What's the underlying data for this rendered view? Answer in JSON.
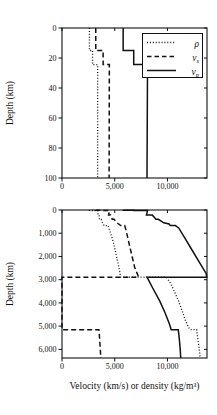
{
  "page": {
    "background": "#ffffff",
    "ink": "#111111"
  },
  "chart_data": [
    {
      "id": "shallow",
      "type": "line",
      "title": "",
      "xlabel": "",
      "ylabel": "Depth (km)",
      "xlim": [
        0,
        13750
      ],
      "ylim": [
        0,
        100
      ],
      "y_inverted": true,
      "grid": false,
      "xticks": [
        {
          "v": 0,
          "label": "0"
        },
        {
          "v": 5000,
          "label": "5,000"
        },
        {
          "v": 10000,
          "label": "10,000"
        }
      ],
      "yticks": [
        {
          "v": 0,
          "label": "0"
        },
        {
          "v": 20,
          "label": "20"
        },
        {
          "v": 40,
          "label": "40"
        },
        {
          "v": 60,
          "label": "60"
        },
        {
          "v": 80,
          "label": "80"
        },
        {
          "v": 100,
          "label": "100"
        }
      ],
      "series": [
        {
          "name": "density",
          "style": "dotted",
          "points": [
            [
              2600,
              0
            ],
            [
              2600,
              15
            ],
            [
              2900,
              15
            ],
            [
              2900,
              24.4
            ],
            [
              3381,
              24.4
            ],
            [
              3379,
              100
            ]
          ]
        },
        {
          "name": "vs",
          "style": "dashed",
          "points": [
            [
              3200,
              0
            ],
            [
              3200,
              15
            ],
            [
              3900,
              15
            ],
            [
              3900,
              24.4
            ],
            [
              4491,
              24.4
            ],
            [
              4465,
              100
            ]
          ]
        },
        {
          "name": "vp",
          "style": "solid",
          "points": [
            [
              5800,
              0
            ],
            [
              5800,
              15
            ],
            [
              6800,
              15
            ],
            [
              6800,
              24.4
            ],
            [
              8110,
              24.4
            ],
            [
              8060,
              100
            ]
          ]
        }
      ],
      "legend": {
        "position": "top-right",
        "entries": [
          {
            "series": "density",
            "label_main": "ρ",
            "label_sub": ""
          },
          {
            "series": "vs",
            "label_main": "v",
            "label_sub": "s"
          },
          {
            "series": "vp",
            "label_main": "v",
            "label_sub": "p"
          }
        ]
      }
    },
    {
      "id": "deep",
      "type": "line",
      "title": "",
      "xlabel": "Velocity (km/s) or density (kg/m³)",
      "ylabel": "Depth (km)",
      "xlim": [
        0,
        13750
      ],
      "ylim": [
        0,
        6371
      ],
      "y_inverted": true,
      "grid": false,
      "xticks": [
        {
          "v": 0,
          "label": "0"
        },
        {
          "v": 5000,
          "label": "5,000"
        },
        {
          "v": 10000,
          "label": "10,000"
        }
      ],
      "yticks": [
        {
          "v": 0,
          "label": "0"
        },
        {
          "v": 1000,
          "label": "1,000"
        },
        {
          "v": 2000,
          "label": "2,000"
        },
        {
          "v": 3000,
          "label": "3,000"
        },
        {
          "v": 4000,
          "label": "4,000"
        },
        {
          "v": 5000,
          "label": "5,000"
        },
        {
          "v": 6000,
          "label": "6,000"
        }
      ],
      "series": [
        {
          "name": "density",
          "style": "dotted",
          "points": [
            [
              2600,
              0
            ],
            [
              2600,
              15
            ],
            [
              2900,
              15
            ],
            [
              2900,
              24.4
            ],
            [
              3381,
              24.4
            ],
            [
              3436,
              220
            ],
            [
              3518,
              220
            ],
            [
              3543,
              400
            ],
            [
              3724,
              400
            ],
            [
              3850,
              550
            ],
            [
              3984,
              670
            ],
            [
              4380,
              670
            ],
            [
              4443,
              771
            ],
            [
              4680,
              1100
            ],
            [
              4900,
              1450
            ],
            [
              5100,
              1850
            ],
            [
              5320,
              2300
            ],
            [
              5490,
              2700
            ],
            [
              5566,
              2891
            ],
            [
              9903,
              2891
            ],
            [
              10290,
              3150
            ],
            [
              10700,
              3550
            ],
            [
              11080,
              3950
            ],
            [
              11400,
              4350
            ],
            [
              11700,
              4750
            ],
            [
              12000,
              5050
            ],
            [
              12166,
              5150
            ],
            [
              12764,
              5150
            ],
            [
              12870,
              5500
            ],
            [
              12990,
              5900
            ],
            [
              13070,
              6200
            ],
            [
              13088,
              6371
            ]
          ]
        },
        {
          "name": "vs",
          "style": "dashed",
          "points": [
            [
              3200,
              0
            ],
            [
              3200,
              15
            ],
            [
              3900,
              15
            ],
            [
              3900,
              24.4
            ],
            [
              4491,
              24.4
            ],
            [
              4418,
              220
            ],
            [
              4612,
              220
            ],
            [
              4770,
              400
            ],
            [
              4932,
              400
            ],
            [
              5220,
              550
            ],
            [
              5570,
              670
            ],
            [
              5945,
              670
            ],
            [
              6090,
              900
            ],
            [
              6240,
              1200
            ],
            [
              6440,
              1600
            ],
            [
              6650,
              2000
            ],
            [
              6880,
              2450
            ],
            [
              7100,
              2700
            ],
            [
              7264,
              2891
            ],
            [
              0,
              2891
            ],
            [
              0,
              5150
            ],
            [
              3504,
              5150
            ],
            [
              3560,
              5500
            ],
            [
              3620,
              5900
            ],
            [
              3660,
              6200
            ],
            [
              3668,
              6371
            ]
          ]
        },
        {
          "name": "vp",
          "style": "solid",
          "points": [
            [
              5800,
              0
            ],
            [
              5800,
              15
            ],
            [
              6800,
              15
            ],
            [
              6800,
              24.4
            ],
            [
              8110,
              24.4
            ],
            [
              8080,
              80
            ],
            [
              8008,
              220
            ],
            [
              8559,
              220
            ],
            [
              8732,
              300
            ],
            [
              8905,
              400
            ],
            [
              9134,
              400
            ],
            [
              9650,
              550
            ],
            [
              10158,
              600
            ],
            [
              10266,
              670
            ],
            [
              10751,
              670
            ],
            [
              11066,
              771
            ],
            [
              11640,
              1200
            ],
            [
              12300,
              1700
            ],
            [
              12960,
              2200
            ],
            [
              13680,
              2741
            ],
            [
              13717,
              2891
            ],
            [
              8065,
              2891
            ],
            [
              8650,
              3400
            ],
            [
              9250,
              3900
            ],
            [
              9750,
              4400
            ],
            [
              10180,
              4900
            ],
            [
              10356,
              5150
            ],
            [
              11028,
              5150
            ],
            [
              11135,
              5600
            ],
            [
              11210,
              6000
            ],
            [
              11262,
              6371
            ]
          ]
        }
      ],
      "legend": null
    }
  ]
}
